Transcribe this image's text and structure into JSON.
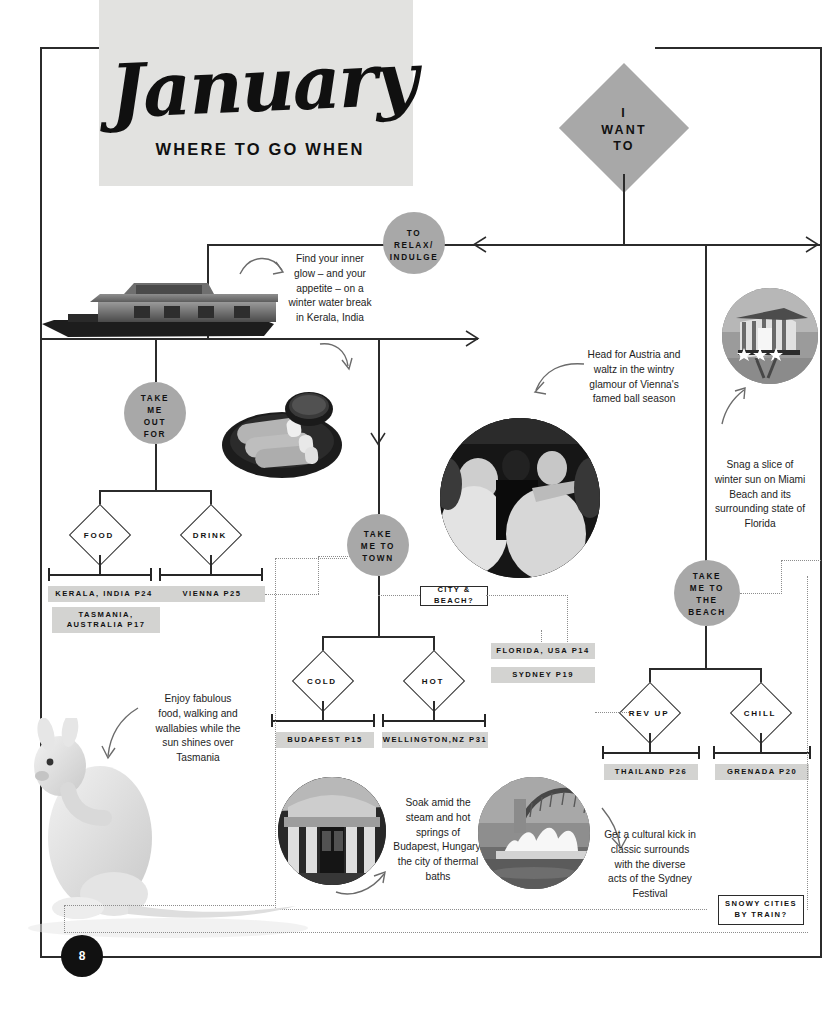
{
  "masthead": {
    "month": "January",
    "subtitle": "WHERE TO GO WHEN"
  },
  "page_number": "8",
  "root": {
    "label": "I\nWANT\nTO",
    "line1": "I",
    "line2": "WANT",
    "line3": "TO"
  },
  "branches": [
    {
      "id": "relax",
      "node_label": "TO\nRELAX/\nINDULGE",
      "lines": [
        "TO",
        "RELAX/",
        "INDULGE"
      ]
    },
    {
      "id": "out-for",
      "node_label": "TAKE\nME\nOUT\nFOR",
      "lines": [
        "TAKE",
        "ME",
        "OUT",
        "FOR"
      ],
      "options": [
        {
          "label": "FOOD",
          "destinations": [
            "KERALA, INDIA P24",
            "TASMANIA,\nAUSTRALIA P17"
          ]
        },
        {
          "label": "DRINK",
          "destinations": [
            "VIENNA P25"
          ]
        }
      ]
    },
    {
      "id": "town",
      "node_label": "TAKE\nME TO\nTOWN",
      "lines": [
        "TAKE",
        "ME TO",
        "TOWN"
      ],
      "options": [
        {
          "label": "COLD",
          "destinations": [
            "BUDAPEST P15"
          ]
        },
        {
          "label": "HOT",
          "destinations": [
            "WELLINGTON,NZ P31"
          ]
        }
      ]
    },
    {
      "id": "beach",
      "node_label": "TAKE\nME TO\nTHE\nBEACH",
      "lines": [
        "TAKE",
        "ME TO",
        "THE",
        "BEACH"
      ],
      "options": [
        {
          "label": "REV UP",
          "destinations": [
            "THAILAND P26"
          ]
        },
        {
          "label": "CHILL",
          "destinations": [
            "GRENADA P20"
          ]
        }
      ]
    }
  ],
  "question_boxes": [
    {
      "id": "city-beach",
      "label": "CITY & BEACH?"
    },
    {
      "id": "snowy-cities",
      "label": "SNOWY CITIES\nBY TRAIN?"
    }
  ],
  "cross_tags": [
    {
      "id": "florida",
      "label": "FLORIDA, USA P14"
    },
    {
      "id": "sydney",
      "label": "SYDNEY P19"
    }
  ],
  "tags": {
    "kerala": "KERALA, INDIA P24",
    "tasmania_l1": "TASMANIA,",
    "tasmania_l2": "AUSTRALIA P17",
    "vienna": "VIENNA P25",
    "budapest": "BUDAPEST P15",
    "wellington": "WELLINGTON,NZ P31",
    "thailand": "THAILAND P26",
    "grenada": "GRENADA P20",
    "florida": "FLORIDA, USA P14",
    "sydney": "SYDNEY P19"
  },
  "diamond_labels": {
    "food": "FOOD",
    "drink": "DRINK",
    "cold": "COLD",
    "hot": "HOT",
    "rev_up": "REV UP",
    "chill": "CHILL"
  },
  "question_labels": {
    "city_beach": "CITY & BEACH?",
    "snowy_l1": "SNOWY CITIES",
    "snowy_l2": "BY TRAIN?"
  },
  "callouts": [
    {
      "id": "kerala",
      "text": "Find your inner glow – and your appetite – on a winter water break in Kerala, India"
    },
    {
      "id": "vienna",
      "text": "Head for Austria and waltz in the wintry glamour of Vienna's famed ball season"
    },
    {
      "id": "miami",
      "text": "Snag a slice of winter sun on Miami Beach and its surrounding state of Florida"
    },
    {
      "id": "tasmania",
      "text": "Enjoy fabulous food, walking and wallabies while the sun shines over Tasmania"
    },
    {
      "id": "budapest",
      "text": "Soak amid the steam and hot springs of Budapest, Hungary, the city of thermal baths"
    },
    {
      "id": "sydney",
      "text": "Get a cultural kick in classic surrounds with the diverse acts of the Sydney Festival"
    }
  ],
  "callout_text": {
    "kerala": "Find your inner glow – and your appetite – on a winter water break in Kerala, India",
    "vienna": "Head for Austria and waltz in the wintry glamour of Vienna's famed ball season",
    "miami": "Snag a slice of winter sun on Miami Beach and its surrounding state of Florida",
    "tasmania": "Enjoy fabulous food, walking and wallabies while the sun shines over Tasmania",
    "budapest": "Soak amid the steam and hot springs of Budapest, Hungary, the city of thermal baths",
    "sydney": "Get a cultural kick in classic surrounds with the diverse acts of the Sydney Festival"
  },
  "images": [
    {
      "id": "houseboat",
      "alt": "kerala-houseboat-photo",
      "shape": "cutout"
    },
    {
      "id": "food-plate",
      "alt": "indian-food-plate-photo",
      "shape": "cutout"
    },
    {
      "id": "ball",
      "alt": "vienna-ball-dancers-photo",
      "shape": "circle"
    },
    {
      "id": "lifeguard",
      "alt": "miami-lifeguard-tower-photo",
      "shape": "circle"
    },
    {
      "id": "kangaroo",
      "alt": "white-wallaby-photo",
      "shape": "cutout"
    },
    {
      "id": "bath",
      "alt": "budapest-thermal-bath-photo",
      "shape": "circle"
    },
    {
      "id": "opera",
      "alt": "sydney-opera-house-photo",
      "shape": "circle"
    }
  ],
  "colors": {
    "node_fill": "#a8a8a8",
    "tag_fill": "#d3d3d1",
    "masthead_fill": "#e2e2e0",
    "line": "#2b2b2b",
    "dotted": "#8d8d8d",
    "page_badge": "#111111"
  }
}
